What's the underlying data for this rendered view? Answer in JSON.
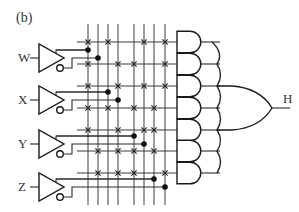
{
  "figure": {
    "label": "(b)",
    "output_label": "H"
  },
  "inputs": [
    {
      "name": "W",
      "center_y": 58,
      "true_col": 0,
      "comp_col": 1
    },
    {
      "name": "X",
      "center_y": 100,
      "true_col": 2,
      "comp_col": 3
    },
    {
      "name": "Y",
      "center_y": 144,
      "true_col": 4,
      "comp_col": 5
    },
    {
      "name": "Z",
      "center_y": 187,
      "true_col": 6,
      "comp_col": 7
    }
  ],
  "grid": {
    "columns_x": [
      88,
      98,
      108,
      118,
      134,
      144,
      154,
      165
    ],
    "rows_y": [
      42,
      64,
      86,
      108,
      130,
      151,
      173
    ],
    "col_top": 24,
    "col_bottom": 205,
    "row_left": 77,
    "row_right": 177
  },
  "and_gates": [
    {
      "row": 0,
      "connections": [
        0,
        2,
        5,
        7
      ]
    },
    {
      "row": 1,
      "connections": [
        0,
        3,
        4,
        7
      ]
    },
    {
      "row": 2,
      "connections": [
        0,
        3,
        5,
        7
      ]
    },
    {
      "row": 3,
      "connections": [
        0,
        2,
        4,
        6
      ]
    },
    {
      "row": 4,
      "connections": [
        0,
        3,
        5,
        6
      ]
    },
    {
      "row": 5,
      "connections": [
        1,
        3,
        4,
        6
      ]
    },
    {
      "row": 6,
      "connections": [
        1,
        3,
        4,
        7
      ]
    }
  ],
  "or_gate": {
    "output": "H"
  },
  "colors": {
    "line": "#2a2a2a",
    "background": "#ffffff"
  }
}
